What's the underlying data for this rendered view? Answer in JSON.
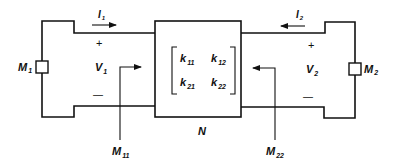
{
  "diagram": {
    "type": "two-port network with measurement elements",
    "network": {
      "label": "N",
      "matrix": {
        "k11": {
          "base": "k",
          "sub": "11"
        },
        "k12": {
          "base": "k",
          "sub": "12"
        },
        "k21": {
          "base": "k",
          "sub": "21"
        },
        "k22": {
          "base": "k",
          "sub": "22"
        }
      }
    },
    "port1": {
      "current": {
        "base": "I",
        "sub": "1",
        "direction": "right"
      },
      "voltage": {
        "base": "V",
        "sub": "1"
      },
      "plus": "+",
      "minus": "—",
      "element": {
        "base": "M",
        "sub": "1"
      },
      "probe": {
        "base": "M",
        "sub": "11"
      }
    },
    "port2": {
      "current": {
        "base": "I",
        "sub": "2",
        "direction": "left"
      },
      "voltage": {
        "base": "V",
        "sub": "2"
      },
      "plus": "+",
      "minus": "—",
      "element": {
        "base": "M",
        "sub": "2"
      },
      "probe": {
        "base": "M",
        "sub": "22"
      }
    },
    "colors": {
      "ink": "#111111",
      "background": "#ffffff"
    }
  }
}
